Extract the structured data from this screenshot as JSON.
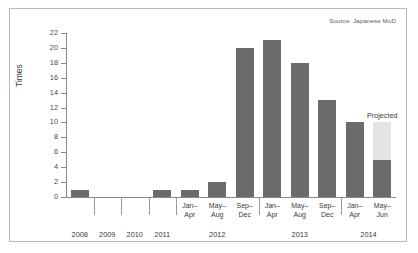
{
  "source_note": "Source: Japanese MoD",
  "projected_label": "Projected",
  "chart_data": {
    "type": "bar",
    "title": "",
    "xlabel": "",
    "ylabel": "Times",
    "ylim": [
      0,
      22
    ],
    "ytick_step": 2,
    "yticks": [
      0,
      2,
      4,
      6,
      8,
      10,
      12,
      14,
      16,
      18,
      20,
      22
    ],
    "grid": false,
    "legend": "none",
    "categories": [
      "2008",
      "2009",
      "2010",
      "2011",
      "Jan–Apr",
      "May–Aug",
      "Sep–Dec",
      "Jan–Apr",
      "May–Aug",
      "Sep–Dec",
      "Jan–Apr",
      "May–Jun"
    ],
    "period_labels": [
      "",
      "",
      "",
      "",
      "Jan–\nApr",
      "May–\nAug",
      "Sep–\nDec",
      "Jan–\nApr",
      "May–\nAug",
      "Sep–\nDec",
      "Jan–\nApr",
      "May–\nJun"
    ],
    "year_groups": [
      {
        "label": "2008",
        "start": 0,
        "end": 0
      },
      {
        "label": "2009",
        "start": 1,
        "end": 1
      },
      {
        "label": "2010",
        "start": 2,
        "end": 2
      },
      {
        "label": "2011",
        "start": 3,
        "end": 3
      },
      {
        "label": "2012",
        "start": 4,
        "end": 6
      },
      {
        "label": "2013",
        "start": 7,
        "end": 9
      },
      {
        "label": "2014",
        "start": 10,
        "end": 11
      }
    ],
    "series": [
      {
        "name": "Actual",
        "color": "#6b6b6b",
        "values": [
          1,
          0,
          0,
          1,
          1,
          2,
          20,
          21,
          18,
          13,
          10,
          5
        ]
      },
      {
        "name": "Projected",
        "color": "#e3e3e3",
        "values": [
          0,
          0,
          0,
          0,
          0,
          0,
          0,
          0,
          0,
          0,
          0,
          5
        ]
      }
    ],
    "annotations": [
      {
        "text": "Projected",
        "category": "May–Jun",
        "year": "2014",
        "value": 10
      },
      {
        "text": "Source: Japanese MoD",
        "position": "top-right"
      }
    ]
  },
  "axis": {
    "y_title": "Times"
  }
}
